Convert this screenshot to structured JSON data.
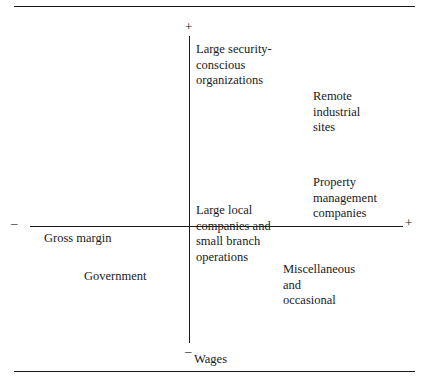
{
  "figure": {
    "kind": "four-quadrant positioning diagram"
  },
  "axes": {
    "horizontal": {
      "name": "Gross margin",
      "negative_sign": "–",
      "positive_sign": "+"
    },
    "vertical": {
      "name": "Wages",
      "positive_sign": "+",
      "negative_sign": "–"
    }
  },
  "segments": [
    {
      "id": "large-security-conscious-organizations",
      "label": "Large security-\nconscious\norganizations",
      "quadrant": "upper-left-of-vertical-axis",
      "gross_margin": "low",
      "wages": "high"
    },
    {
      "id": "remote-industrial-sites",
      "label": "Remote\nindustrial\nsites",
      "quadrant": "upper-right",
      "gross_margin": "high",
      "wages": "high"
    },
    {
      "id": "property-management-companies",
      "label": "Property\nmanagement\ncompanies",
      "quadrant": "upper-right",
      "gross_margin": "high",
      "wages": "slightly-high"
    },
    {
      "id": "large-local-companies-and-small-branch-operations",
      "label": "Large local\ncompanies and\nsmall branch\noperations",
      "quadrant": "origin",
      "gross_margin": "neutral",
      "wages": "neutral"
    },
    {
      "id": "government",
      "label": "Government",
      "quadrant": "lower-left",
      "gross_margin": "low",
      "wages": "low"
    },
    {
      "id": "miscellaneous-and-occasional",
      "label": "Miscellaneous\nand\noccasional",
      "quadrant": "lower-right",
      "gross_margin": "high",
      "wages": "low"
    }
  ]
}
